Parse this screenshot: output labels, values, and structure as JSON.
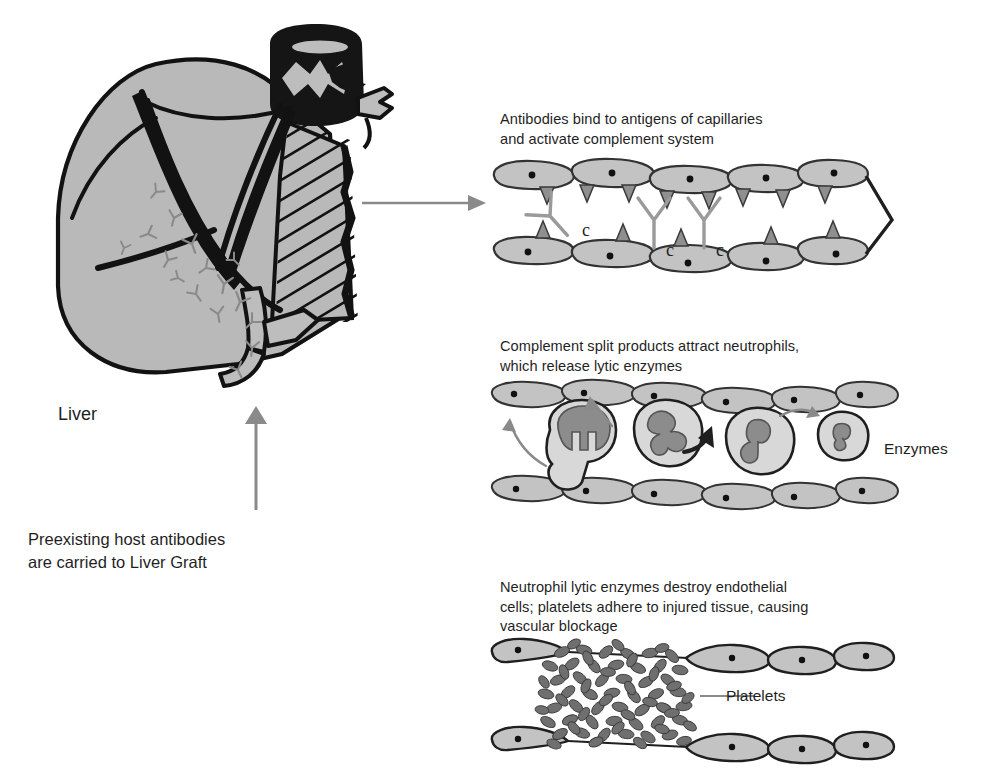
{
  "figure": {
    "title_hidden": "Hyperacute rejection of a liver graft",
    "colors": {
      "cell_fill": "#c3c3c3",
      "cell_fill_light": "#d8d8d8",
      "outline": "#1f1f1f",
      "nucleus": "#8c8c8c",
      "antibody_gray": "#8a8a8a",
      "arrow_gray": "#8a8a8a",
      "platelet": "#6f6f6f",
      "liver_gray": "#b9b9b9",
      "liver_outline": "#121212",
      "text": "#1f1f1f"
    }
  },
  "liver": {
    "organ_label": "Liver",
    "caption": "Preexisting host antibodies\nare carried to Liver Graft",
    "arrow_up_name": "antibody-flow-arrow",
    "transfer_arrow_name": "liver-to-capillary-arrow"
  },
  "panels": [
    {
      "id": "panel-antibody-binding",
      "caption": "Antibodies bind to antigens of capillaries\nand activate complement system",
      "complement_labels": [
        "c",
        "c",
        "c"
      ],
      "antibody_count": 3,
      "top_cell_count": 5,
      "bottom_cell_count": 5
    },
    {
      "id": "panel-neutrophil-attraction",
      "caption": "Complement split products attract neutrophils,\nwhich release lytic enzymes",
      "side_label": "Enzymes",
      "neutrophil_count": 4,
      "top_cell_count": 6,
      "bottom_cell_count": 6
    },
    {
      "id": "panel-vascular-blockage",
      "caption": "Neutrophil lytic enzymes destroy endothelial\ncells; platelets adhere to injured tissue, causing\nvascular blockage",
      "callout_label": "Platelets",
      "platelet_count": 96,
      "top_cell_count": 4,
      "bottom_cell_count": 4
    }
  ]
}
